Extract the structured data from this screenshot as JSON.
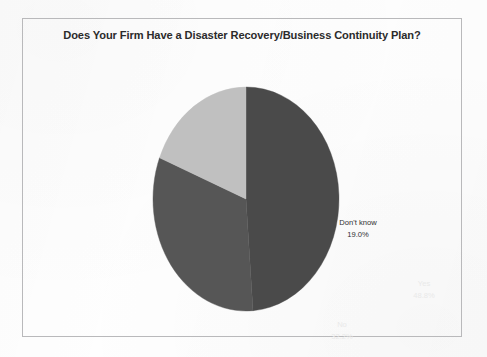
{
  "chart_data": {
    "type": "pie",
    "title": "Does Your Firm Have a Disaster Recovery/Business Continuity Plan?",
    "xlabel": "",
    "ylabel": "",
    "legend_position": "none",
    "grid": false,
    "labels_inside_slices": true,
    "start_angle_deg": 0,
    "direction": "clockwise",
    "categories": [
      "Yes",
      "No",
      "Don't know"
    ],
    "values": [
      48.8,
      32.2,
      19.0
    ],
    "value_unit": "%",
    "total": 100.0,
    "slices": [
      {
        "label": "Yes",
        "value": 48.8,
        "value_text": "48.8%",
        "color": "#4a4a4a",
        "text_color": "#e9e9e9",
        "start_deg": 0.0,
        "end_deg": 175.68
      },
      {
        "label": "No",
        "value": 32.2,
        "value_text": "32.2%",
        "color": "#565656",
        "text_color": "#e9e9e9",
        "start_deg": 175.68,
        "end_deg": 291.6
      },
      {
        "label": "Don't know",
        "value": 19.0,
        "value_text": "19.0%",
        "color": "#c0c0c0",
        "text_color": "#2f2f2f",
        "start_deg": 291.6,
        "end_deg": 360.0
      }
    ]
  },
  "frame": {
    "border_color": "#b9b9bb",
    "background": "#fefefe"
  },
  "geometry": {
    "center_x": 94,
    "center_y": 113,
    "radius_x": 93,
    "radius_y": 112
  }
}
